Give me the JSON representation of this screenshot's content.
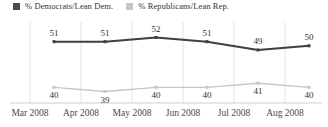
{
  "legend": {
    "items": [
      {
        "label": "% Democrats/Lean Dem.",
        "color": "#4b4b4b"
      },
      {
        "label": "% Republicans/Lean Rep.",
        "color": "#c6c6c6"
      }
    ]
  },
  "chart_data": {
    "type": "line",
    "categories": [
      "Mar 2008",
      "Apr 2008",
      "May 2008",
      "Jun 2008",
      "Jul 2008",
      "Aug 2008"
    ],
    "series": [
      {
        "name": "% Democrats/Lean Dem.",
        "values": [
          51,
          51,
          52,
          51,
          49,
          50
        ],
        "color": "#3f3f3f",
        "label_position": "above"
      },
      {
        "name": "% Republicans/Lean Rep.",
        "values": [
          40,
          39,
          40,
          40,
          41,
          40
        ],
        "color": "#c6c6c6",
        "label_position": "below"
      }
    ],
    "value_labels": true,
    "grid": "vertical",
    "legend_position": "top",
    "ylim": [
      37,
      54
    ]
  },
  "colors": {
    "background": "#ffffff",
    "grid": "#e4e4e4",
    "axis": "#cfcfcf",
    "value_text": "#333333",
    "month_text": "#4a4a4a"
  }
}
